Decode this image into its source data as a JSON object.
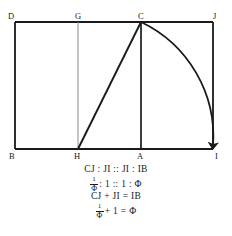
{
  "figure": {
    "stroke_color": "#1a1a1a",
    "light_stroke_color": "#8c8c8c",
    "background": "#ffffff",
    "vertices": [
      {
        "id": "D",
        "label": "D",
        "x": 15,
        "y": 22,
        "label_x": 8,
        "label_y": 19
      },
      {
        "id": "G",
        "label": "G",
        "x": 78,
        "y": 22,
        "label_x": 75,
        "label_y": 19
      },
      {
        "id": "C",
        "label": "C",
        "x": 141,
        "y": 22,
        "label_x": 138,
        "label_y": 19
      },
      {
        "id": "J",
        "label": "J",
        "x": 213,
        "y": 22,
        "label_x": 213,
        "label_y": 19
      },
      {
        "id": "B",
        "label": "B",
        "x": 15,
        "y": 149,
        "label_x": 9,
        "label_y": 159
      },
      {
        "id": "H",
        "label": "H",
        "x": 78,
        "y": 149,
        "label_x": 74,
        "label_y": 159
      },
      {
        "id": "A",
        "label": "A",
        "x": 141,
        "y": 149,
        "label_x": 137,
        "label_y": 159
      },
      {
        "id": "I",
        "label": "I",
        "x": 213,
        "y": 149,
        "label_x": 215,
        "label_y": 159
      }
    ],
    "segments": [
      {
        "name": "rectangle-top-DJ",
        "from": "D",
        "to": "J",
        "weight": "heavy"
      },
      {
        "name": "rectangle-left-DB",
        "from": "D",
        "to": "B",
        "weight": "heavy"
      },
      {
        "name": "rectangle-bottom-BI",
        "from": "B",
        "to": "I",
        "weight": "heavy"
      },
      {
        "name": "rectangle-right-JI",
        "from": "J",
        "to": "I",
        "weight": "heavy"
      },
      {
        "name": "vertical-GH",
        "from": "G",
        "to": "H",
        "weight": "light"
      },
      {
        "name": "vertical-CA",
        "from": "C",
        "to": "A",
        "weight": "heavy"
      },
      {
        "name": "diagonal-HC",
        "from": "H",
        "to": "C",
        "weight": "heavy"
      }
    ],
    "arc": {
      "name": "arc-C-to-I",
      "center": "A",
      "from": "C",
      "to": "I",
      "radius": 127,
      "has_arrowhead": true,
      "arrowhead_at": "I",
      "arrowhead_direction": "down"
    }
  },
  "equations": [
    {
      "id": "line1",
      "text": "CJ : JI :: JI : IB"
    },
    {
      "id": "line2",
      "fraction_numerator": "1",
      "fraction_denominator": "Φ",
      "rest": " : 1 :: 1 : Φ"
    },
    {
      "id": "line3",
      "text": "CJ + JI = IB"
    },
    {
      "id": "line4",
      "fraction_numerator": "1",
      "fraction_denominator": "Φ",
      "rest": " + 1 = Φ"
    }
  ]
}
